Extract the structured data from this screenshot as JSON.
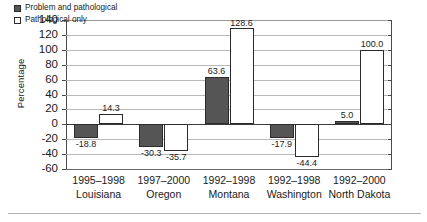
{
  "chart_data": {
    "type": "bar",
    "title": "",
    "xlabel": "",
    "ylabel": "Percentage",
    "ylim": [
      -60,
      140
    ],
    "yticks": [
      140,
      120,
      100,
      80,
      60,
      40,
      20,
      0,
      -20,
      -40,
      -60
    ],
    "grid": true,
    "legend_position": "top-left",
    "categories": [
      {
        "period": "1995–1998",
        "place": "Louisiana"
      },
      {
        "period": "1997–2000",
        "place": "Oregon"
      },
      {
        "period": "1992–1998",
        "place": "Montana"
      },
      {
        "period": "1992–1998",
        "place": "Washington"
      },
      {
        "period": "1992–2000",
        "place": "North Dakota"
      }
    ],
    "series": [
      {
        "name": "Problem and pathological",
        "swatch": "filled",
        "color": "#555555",
        "values": [
          -18.8,
          -30.3,
          63.6,
          -17.9,
          5.0
        ],
        "labels": [
          "-18.8",
          "-30.3",
          "63.6",
          "-17.9",
          "5.0"
        ]
      },
      {
        "name": "Pathological only",
        "swatch": "hollow",
        "color": "#ffffff",
        "values": [
          14.3,
          -35.7,
          128.6,
          -44.4,
          100.0
        ],
        "labels": [
          "14.3",
          "-35.7",
          "128.6",
          "-44.4",
          "100.0"
        ]
      }
    ]
  },
  "axis": {
    "y_title": "Percentage",
    "tick_labels": [
      "140",
      "120",
      "100",
      "80",
      "60",
      "40",
      "20",
      "0",
      "-20",
      "-40",
      "-60"
    ]
  },
  "legend": {
    "items": [
      {
        "label": "Problem and pathological"
      },
      {
        "label": "Pathological only"
      }
    ]
  }
}
